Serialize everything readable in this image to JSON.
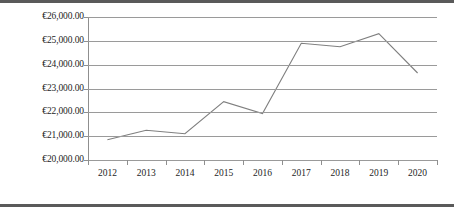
{
  "chart_data": {
    "type": "line",
    "title": "",
    "subtitle": "",
    "xlabel": "",
    "ylabel": "",
    "categories": [
      "2012",
      "2013",
      "2014",
      "2015",
      "2016",
      "2017",
      "2018",
      "2019",
      "2020"
    ],
    "series": [
      {
        "name": "",
        "values": [
          20850,
          21250,
          21100,
          22450,
          21950,
          24900,
          24750,
          25300,
          23650
        ]
      }
    ],
    "ylim": [
      20000,
      26000
    ],
    "ytick_values": [
      26000,
      25000,
      24000,
      23000,
      22000,
      21000,
      20000
    ],
    "ytick_labels": [
      "€26,000.00",
      "€25,000.00",
      "€24,000.00",
      "€23,000.00",
      "€22,000.00",
      "€21,000.00",
      "€20,000.00"
    ],
    "currency_symbol": "€",
    "grid": true,
    "grid_axis": "y",
    "legend": false,
    "legend_position": "none",
    "line_color": "#7f7f7f",
    "grid_color": "#9a9a9a",
    "axis_color": "#8f8f8f",
    "background_color": "#ffffff",
    "markers": false
  },
  "figure": {
    "border_color": "#5a5a5a",
    "has_top_border": true,
    "has_bottom_border": true
  }
}
